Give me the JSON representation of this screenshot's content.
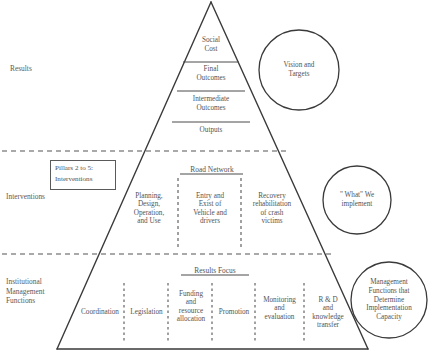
{
  "diagram": {
    "side_labels": [
      {
        "name": "results",
        "text": "Results"
      },
      {
        "name": "interventions",
        "text": "Interventions"
      },
      {
        "name": "institutional-management-functions",
        "text": "Institutional\nManagement\nFunctions"
      }
    ],
    "results_band": {
      "rows": [
        {
          "text": "Social\nCost"
        },
        {
          "text": "Final\nOutcomes"
        },
        {
          "text": "Intermediate\nOutcomes"
        },
        {
          "text": "Outputs"
        }
      ]
    },
    "interventions_band": {
      "header": "Road Network",
      "pillar_box": "Pillars 2 to 5:\nInterventions",
      "columns": [
        {
          "text": "Planning,\nDesign,\nOperation,\nand Use"
        },
        {
          "text": "Entry and\nExist of\nVehicle and\ndrivers"
        },
        {
          "text": "Recovery\nrehabilitation\nof crash\nvictims"
        }
      ]
    },
    "institutional_band": {
      "header": "Results Focus",
      "columns": [
        {
          "text": "Coordination"
        },
        {
          "text": "Legislation"
        },
        {
          "text": "Funding\nand\nresource\nallocation"
        },
        {
          "text": "Promotion"
        },
        {
          "text": "Monitoring\nand\nevaluation"
        },
        {
          "text": "R & D\nand\nknowledge\ntransfer"
        }
      ]
    },
    "callouts": [
      {
        "name": "vision-and-targets",
        "text": "Vision and\nTargets"
      },
      {
        "name": "what-we-implement",
        "text": "\" What\" We\nimplement"
      },
      {
        "name": "management-functions-capacity",
        "text": "Management\nFunctions that\nDetermine\nImplementation\nCapacity"
      }
    ],
    "colors": {
      "stroke": "#3a3a3a",
      "text": "#545454",
      "dashed": "#555555",
      "background": "#ffffff"
    }
  }
}
